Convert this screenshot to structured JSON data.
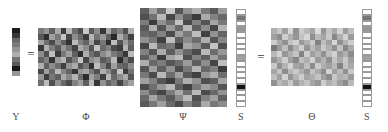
{
  "figure": {
    "equation": "Y = Φ Ψ S = Θ S",
    "operators": {
      "equals_left": "=",
      "equals_right": "="
    }
  },
  "labels": {
    "y": "Y",
    "phi": "Φ",
    "psi": "Ψ",
    "s_left": "S",
    "theta": "Θ",
    "s_right": "S"
  },
  "chart_data": {
    "type": "heatmap",
    "colormap": "grayscale",
    "value_range": [
      0,
      255
    ],
    "panels": [
      {
        "name": "Y",
        "label": "Y",
        "role": "measurement-vector",
        "rows": 10,
        "cols": 1,
        "values": [
          [
            30
          ],
          [
            55
          ],
          [
            105
          ],
          [
            120
          ],
          [
            150
          ],
          [
            175
          ],
          [
            118
          ],
          [
            88
          ],
          [
            25
          ],
          [
            150
          ]
        ]
      },
      {
        "name": "Phi",
        "label": "Φ",
        "role": "measurement-matrix",
        "rows": 10,
        "cols": 17,
        "values": [
          [
            120,
            150,
            95,
            170,
            60,
            185,
            110,
            75,
            200,
            90,
            140,
            55,
            165,
            100,
            130,
            80,
            175
          ],
          [
            88,
            45,
            160,
            120,
            195,
            70,
            140,
            105,
            60,
            180,
            115,
            150,
            95,
            40,
            170,
            125,
            65
          ],
          [
            165,
            110,
            75,
            140,
            95,
            50,
            185,
            130,
            100,
            160,
            70,
            120,
            45,
            190,
            85,
            155,
            110
          ],
          [
            55,
            175,
            125,
            90,
            150,
            115,
            65,
            170,
            140,
            85,
            195,
            105,
            130,
            75,
            60,
            180,
            95
          ],
          [
            140,
            80,
            190,
            60,
            120,
            160,
            95,
            45,
            175,
            110,
            85,
            140,
            165,
            120,
            100,
            55,
            185
          ],
          [
            100,
            130,
            50,
            155,
            180,
            85,
            125,
            195,
            70,
            140,
            160,
            90,
            110,
            185,
            45,
            120,
            75
          ],
          [
            175,
            95,
            140,
            110,
            65,
            145,
            170,
            85,
            120,
            50,
            190,
            130,
            75,
            160,
            105,
            95,
            140
          ],
          [
            70,
            160,
            105,
            185,
            130,
            100,
            55,
            150,
            165,
            120,
            80,
            175,
            140,
            90,
            195,
            60,
            115
          ],
          [
            150,
            60,
            120,
            95,
            170,
            135,
            180,
            110,
            45,
            160,
            125,
            65,
            185,
            105,
            140,
            170,
            85
          ],
          [
            110,
            185,
            80,
            145,
            105,
            75,
            130,
            160,
            95,
            185,
            55,
            145,
            100,
            125,
            70,
            130,
            160
          ]
        ]
      },
      {
        "name": "Psi",
        "label": "Ψ",
        "role": "sparsifying-basis",
        "rows": 17,
        "cols": 10,
        "values": [
          [
            95,
            160,
            110,
            200,
            85,
            145,
            175,
            120,
            90,
            155
          ],
          [
            80,
            115,
            185,
            70,
            140,
            95,
            60,
            170,
            130,
            105
          ],
          [
            125,
            60,
            145,
            110,
            195,
            75,
            130,
            85,
            165,
            120
          ],
          [
            90,
            175,
            85,
            155,
            105,
            185,
            95,
            140,
            70,
            180
          ],
          [
            105,
            95,
            130,
            75,
            160,
            120,
            190,
            65,
            145,
            100
          ],
          [
            145,
            120,
            65,
            190,
            95,
            140,
            110,
            175,
            85,
            135
          ],
          [
            70,
            185,
            105,
            120,
            60,
            165,
            145,
            90,
            195,
            80
          ],
          [
            130,
            85,
            170,
            95,
            145,
            105,
            75,
            185,
            110,
            150
          ],
          [
            95,
            140,
            60,
            165,
            185,
            80,
            130,
            95,
            160,
            115
          ],
          [
            175,
            105,
            125,
            85,
            110,
            155,
            95,
            140,
            70,
            190
          ],
          [
            85,
            160,
            95,
            145,
            75,
            120,
            180,
            105,
            130,
            60
          ],
          [
            120,
            75,
            185,
            110,
            160,
            90,
            65,
            150,
            175,
            110
          ],
          [
            160,
            130,
            85,
            60,
            120,
            175,
            145,
            80,
            95,
            165
          ],
          [
            75,
            110,
            150,
            185,
            95,
            65,
            120,
            160,
            140,
            85
          ],
          [
            140,
            95,
            70,
            125,
            170,
            110,
            185,
            75,
            105,
            145
          ],
          [
            105,
            165,
            120,
            90,
            140,
            185,
            80,
            130,
            160,
            95
          ],
          [
            90,
            120,
            160,
            105,
            75,
            130,
            95,
            170,
            120,
            140
          ]
        ]
      },
      {
        "name": "S-left",
        "label": "S",
        "role": "sparse-coefficient-vector",
        "rows": 17,
        "cols": 1,
        "values": [
          [
            255
          ],
          [
            120
          ],
          [
            255
          ],
          [
            150
          ],
          [
            255
          ],
          [
            255
          ],
          [
            255
          ],
          [
            255
          ],
          [
            160
          ],
          [
            255
          ],
          [
            255
          ],
          [
            255
          ],
          [
            255
          ],
          [
            20
          ],
          [
            255
          ],
          [
            255
          ],
          [
            255
          ]
        ]
      },
      {
        "name": "Theta",
        "label": "Θ",
        "role": "sensing-matrix",
        "rows": 10,
        "cols": 15,
        "values": [
          [
            175,
            200,
            160,
            215,
            145,
            205,
            185,
            165,
            220,
            150,
            195,
            170,
            210,
            155,
            190
          ],
          [
            160,
            140,
            205,
            175,
            150,
            195,
            215,
            145,
            185,
            165,
            200,
            135,
            175,
            210,
            155
          ],
          [
            205,
            170,
            145,
            195,
            210,
            155,
            175,
            200,
            130,
            190,
            160,
            215,
            145,
            180,
            205
          ],
          [
            120,
            155,
            190,
            140,
            175,
            205,
            150,
            185,
            160,
            200,
            175,
            145,
            195,
            135,
            170
          ],
          [
            185,
            210,
            150,
            175,
            195,
            130,
            205,
            160,
            180,
            145,
            190,
            210,
            155,
            175,
            140
          ],
          [
            150,
            175,
            205,
            160,
            135,
            190,
            175,
            210,
            155,
            180,
            145,
            195,
            170,
            200,
            160
          ],
          [
            200,
            145,
            180,
            210,
            165,
            155,
            190,
            140,
            205,
            175,
            160,
            185,
            130,
            195,
            170
          ],
          [
            165,
            195,
            140,
            185,
            200,
            175,
            150,
            195,
            170,
            140,
            210,
            160,
            185,
            145,
            200
          ],
          [
            190,
            160,
            210,
            150,
            180,
            205,
            165,
            175,
            195,
            160,
            140,
            200,
            175,
            185,
            155
          ],
          [
            145,
            185,
            170,
            200,
            155,
            180,
            195,
            165,
            150,
            205,
            175,
            190,
            160,
            140,
            185
          ]
        ]
      },
      {
        "name": "S-right",
        "label": "S",
        "role": "sparse-coefficient-vector",
        "rows": 17,
        "cols": 1,
        "values": [
          [
            255
          ],
          [
            120
          ],
          [
            255
          ],
          [
            150
          ],
          [
            255
          ],
          [
            255
          ],
          [
            255
          ],
          [
            255
          ],
          [
            160
          ],
          [
            255
          ],
          [
            255
          ],
          [
            255
          ],
          [
            255
          ],
          [
            20
          ],
          [
            255
          ],
          [
            255
          ],
          [
            255
          ]
        ]
      }
    ]
  }
}
